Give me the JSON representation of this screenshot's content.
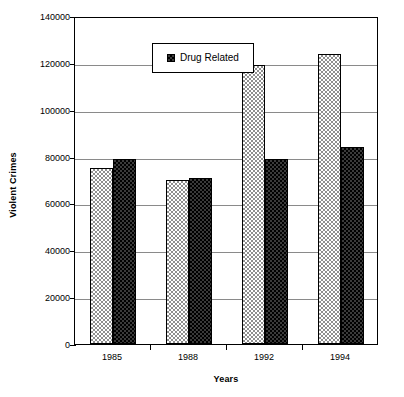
{
  "chart_data": {
    "type": "bar",
    "title": "",
    "subtitle": "",
    "xlabel": "Years",
    "ylabel": "Violent Crimes",
    "categories": [
      "1985",
      "1988",
      "1992",
      "1994"
    ],
    "series": [
      {
        "name": "Total Violent Crimes",
        "values": [
          75000,
          70000,
          119000,
          124000
        ],
        "fill": "light-dither",
        "in_legend": false
      },
      {
        "name": "Drug Related",
        "values": [
          79000,
          71000,
          79000,
          84000
        ],
        "fill": "dark-dither",
        "in_legend": true
      }
    ],
    "ylim": [
      0,
      140000
    ],
    "yticks": [
      0,
      20000,
      40000,
      60000,
      80000,
      100000,
      120000,
      140000
    ],
    "ytick_labels": [
      "0",
      "20000",
      "40000",
      "60000",
      "80000",
      "100000",
      "120000",
      "140000"
    ],
    "grid": true,
    "grid_axis": "y",
    "legend_position": "top-center",
    "legend_entries": [
      "Drug Related"
    ],
    "plot_border": true,
    "colors": {
      "axis": "#000000",
      "gridline": "#8a8a8a",
      "series_light": "#8f8f8f",
      "series_dark": "#000000",
      "background": "#ffffff"
    }
  },
  "legend": {
    "label": "Drug Related",
    "swatch_name": "dark-dither-swatch"
  },
  "axes": {
    "y_title": "Violent Crimes",
    "x_title": "Years"
  }
}
